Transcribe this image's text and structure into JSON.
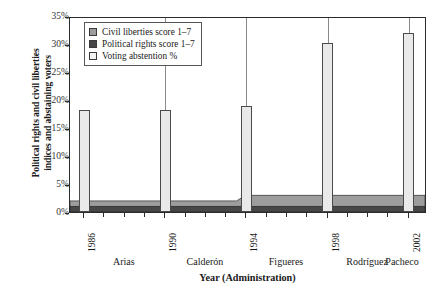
{
  "chart_data": {
    "type": "area",
    "title": "",
    "xlabel": "Year (Administration)",
    "ylabel_line1": "Political rights and civil liberties",
    "ylabel_line2": "indices and abstaining voters",
    "ylim": [
      0,
      35
    ],
    "ytick_labels": [
      "0%",
      "5%",
      "10%",
      "15%",
      "20%",
      "25%",
      "30%",
      "35%"
    ],
    "ytick_values": [
      0,
      5,
      10,
      15,
      20,
      25,
      30,
      35
    ],
    "xlim": [
      1985.3,
      2002.9
    ],
    "grid": "vertical-at-election-years",
    "legend_position": "top-left-inside",
    "x_years": [
      1986,
      1987,
      1988,
      1989,
      1990,
      1991,
      1992,
      1993,
      1994,
      1995,
      1996,
      1997,
      1998,
      1999,
      2000,
      2001,
      2002
    ],
    "election_years": [
      1986,
      1990,
      1994,
      1998,
      2002
    ],
    "administrations": [
      "Arias",
      "Calderón",
      "Figueres",
      "Rodríguez",
      "Pacheco"
    ],
    "series": [
      {
        "name": "Voting abstention %",
        "type": "bar",
        "color": "#e9e9e9",
        "categories": [
          1986,
          1990,
          1994,
          1998,
          2002
        ],
        "values": [
          18.3,
          18.2,
          19.0,
          30.2,
          31.9
        ]
      },
      {
        "name": "Civil liberties score 1–7",
        "type": "area-stacked",
        "color": "#9d9d9d",
        "x": [
          1986,
          1987,
          1988,
          1989,
          1990,
          1991,
          1992,
          1993,
          1994,
          1995,
          1996,
          1997,
          1998,
          1999,
          2000,
          2001,
          2002
        ],
        "values": [
          1,
          1,
          1,
          1,
          1,
          1,
          1,
          1,
          2,
          2,
          2,
          2,
          2,
          2,
          2,
          2,
          2
        ]
      },
      {
        "name": "Political rights score 1–7",
        "type": "area-stacked",
        "color": "#474747",
        "x": [
          1986,
          1987,
          1988,
          1989,
          1990,
          1991,
          1992,
          1993,
          1994,
          1995,
          1996,
          1997,
          1998,
          1999,
          2000,
          2001,
          2002
        ],
        "values": [
          1,
          1,
          1,
          1,
          1,
          1,
          1,
          1,
          1,
          1,
          1,
          1,
          1,
          1,
          1,
          1,
          1
        ]
      }
    ]
  },
  "legend": {
    "items": [
      {
        "label": "Civil liberties score 1–7",
        "color": "#9d9d9d"
      },
      {
        "label": "Political rights score 1–7",
        "color": "#474747"
      },
      {
        "label": "Voting abstention %",
        "color": "#f2f2f2"
      }
    ]
  },
  "axes": {
    "y_label_line1": "Political rights and civil liberties",
    "y_label_line2": "indices and abstaining voters",
    "x_label": "Year (Administration)",
    "y_ticks": [
      {
        "label": "35%",
        "value": 35
      },
      {
        "label": "30%",
        "value": 30
      },
      {
        "label": "25%",
        "value": 25
      },
      {
        "label": "20%",
        "value": 20
      },
      {
        "label": "15%",
        "value": 15
      },
      {
        "label": "10%",
        "value": 10
      },
      {
        "label": "5%",
        "value": 5
      },
      {
        "label": "0%",
        "value": 0
      }
    ],
    "x_ticks": [
      {
        "label": "1986",
        "value": 1986,
        "major": true
      },
      {
        "label": "1990",
        "value": 1990,
        "major": true
      },
      {
        "label": "1994",
        "value": 1994,
        "major": true
      },
      {
        "label": "1998",
        "value": 1998,
        "major": true
      },
      {
        "label": "2002",
        "value": 2002,
        "major": true
      }
    ],
    "administrations": [
      {
        "label": "Arias",
        "center_year": 1988
      },
      {
        "label": "Calderón",
        "center_year": 1992
      },
      {
        "label": "Figueres",
        "center_year": 1996
      },
      {
        "label": "Rodríguez",
        "center_year": 2000
      },
      {
        "label": "Pacheco",
        "center_year": 2002.6
      }
    ]
  }
}
